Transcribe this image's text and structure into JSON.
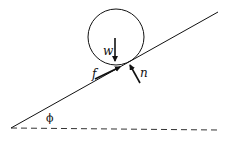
{
  "diagram": {
    "labels": {
      "weight": "w",
      "friction": "f",
      "normal": "n",
      "angle": "ϕ"
    },
    "colors": {
      "stroke": "#111111",
      "background": "#ffffff"
    }
  }
}
